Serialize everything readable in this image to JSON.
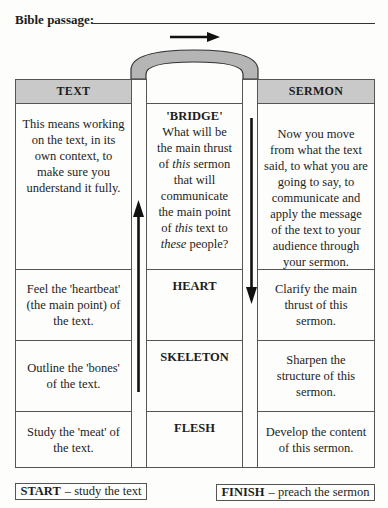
{
  "header": {
    "passage_label": "Bible passage:"
  },
  "columns": {
    "left": "TEXT",
    "right": "SERMON"
  },
  "rows": [
    {
      "left": "This means working on the text, in its own context, to make sure you understand it fully.",
      "middle_title": "'BRIDGE'",
      "middle_body": [
        "What will be",
        "the main thrust",
        "of ",
        "this",
        " sermon",
        "that will",
        "communicate",
        "the main point",
        "of ",
        "this",
        " text to",
        "these",
        " people?"
      ],
      "right": "Now you move from what the text said, to what you are going to say, to communicate and apply the message of the text to your audience through your sermon."
    },
    {
      "left": "Feel the 'heartbeat' (the main point) of the text.",
      "middle_title": "HEART",
      "right": "Clarify the main thrust of this sermon."
    },
    {
      "left": "Outline the 'bones' of the text.",
      "middle_title": "SKELETON",
      "right": "Sharpen the structure of this sermon."
    },
    {
      "left": "Study the 'meat' of the text.",
      "middle_title": "FLESH",
      "right": "Develop the content of this sermon."
    }
  ],
  "footer": {
    "start_bold": "START",
    "start_rest": "– study the text",
    "finish_bold": "FINISH",
    "finish_rest": "– preach the sermon"
  },
  "colors": {
    "header_fill": "#c9c9c9",
    "arch_fill": "#b5b5b5",
    "line": "#555555"
  }
}
